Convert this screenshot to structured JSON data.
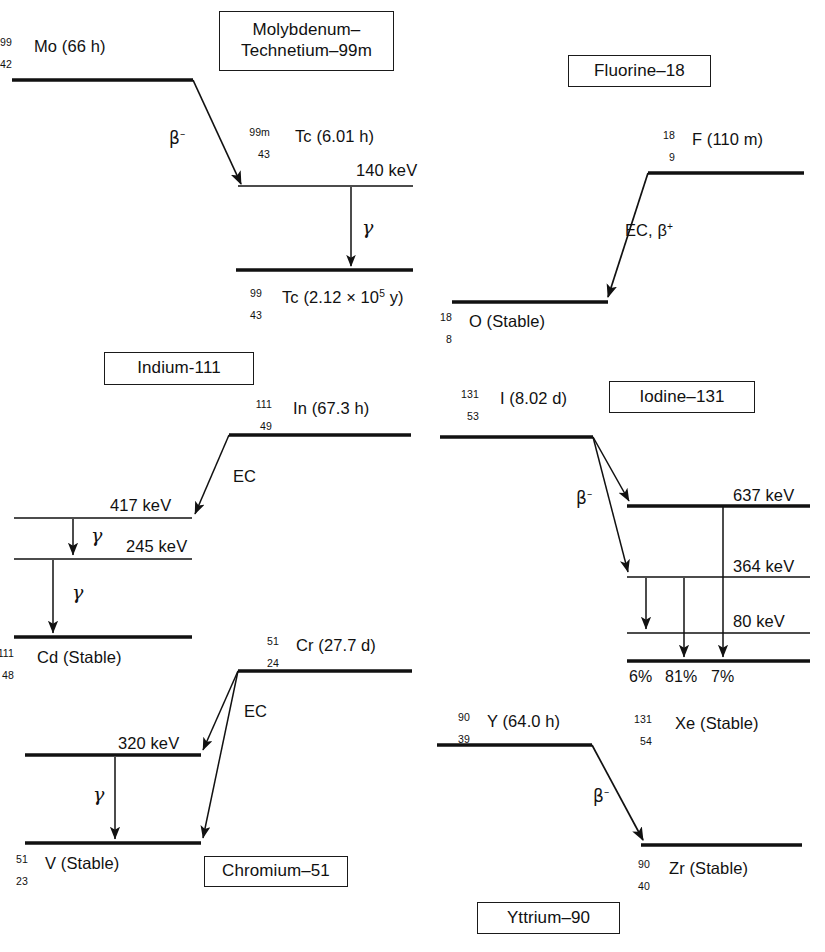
{
  "figure": {
    "type": "nuclear-decay-scheme-diagram",
    "panel_count": 6
  },
  "panels": [
    {
      "id": "molybdenum-technetium",
      "title": "Molybdenum–\nTechnetium–99m",
      "parent": {
        "mass": "99",
        "atomic": "42",
        "symbol": "Mo",
        "halflife": "(66 h)",
        "text": "Mo (66 h)"
      },
      "transitions": [
        {
          "label": "β⁻",
          "type": "beta-minus"
        },
        {
          "label": "γ",
          "type": "gamma"
        }
      ],
      "levels": [
        {
          "name": "Tc-99m",
          "energy": "140 keV",
          "label_mass": "99m",
          "label_atomic": "43",
          "label_symbol": "Tc",
          "label_halflife": "(6.01 h)"
        },
        {
          "name": "Tc-99",
          "energy": "",
          "label_mass": "99",
          "label_atomic": "43",
          "label_symbol": "Tc",
          "label_halflife": "(2.12 × 10⁵ y)"
        }
      ]
    },
    {
      "id": "fluorine-18",
      "title": "Fluorine–18",
      "parent": {
        "mass": "18",
        "atomic": "9",
        "symbol": "F",
        "halflife": "(110 m)"
      },
      "transitions": [
        {
          "label": "EC, β⁺",
          "type": "electron-capture-beta-plus"
        }
      ],
      "levels": [
        {
          "name": "O-18",
          "label_mass": "18",
          "label_atomic": "8",
          "label_symbol": "O",
          "label_halflife": "(Stable)"
        }
      ]
    },
    {
      "id": "indium-111",
      "title": "Indium-111",
      "parent": {
        "mass": "111",
        "atomic": "49",
        "symbol": "In",
        "halflife": "(67.3 h)"
      },
      "transitions": [
        {
          "label": "EC",
          "type": "electron-capture"
        },
        {
          "label": "γ",
          "type": "gamma"
        },
        {
          "label": "γ",
          "type": "gamma"
        }
      ],
      "levels": [
        {
          "name": "level-417",
          "energy": "417 keV"
        },
        {
          "name": "level-245",
          "energy": "245 keV"
        },
        {
          "name": "Cd-111",
          "label_mass": "111",
          "label_atomic": "48",
          "label_symbol": "Cd",
          "label_halflife": "(Stable)"
        }
      ]
    },
    {
      "id": "iodine-131",
      "title": "Iodine–131",
      "parent": {
        "mass": "131",
        "atomic": "53",
        "symbol": "I",
        "halflife": "(8.02 d)"
      },
      "transitions": [
        {
          "label": "β⁻",
          "type": "beta-minus"
        }
      ],
      "levels": [
        {
          "name": "level-637",
          "energy": "637 keV"
        },
        {
          "name": "level-364",
          "energy": "364 keV"
        },
        {
          "name": "level-80",
          "energy": "80 keV"
        },
        {
          "name": "Xe-131",
          "label_mass": "131",
          "label_atomic": "54",
          "label_symbol": "Xe",
          "label_halflife": "(Stable)"
        }
      ],
      "branches": [
        "6%",
        "81%",
        "7%"
      ]
    },
    {
      "id": "chromium-51",
      "title": "Chromium–51",
      "parent": {
        "mass": "51",
        "atomic": "24",
        "symbol": "Cr",
        "halflife": "(27.7 d)"
      },
      "transitions": [
        {
          "label": "EC",
          "type": "electron-capture"
        },
        {
          "label": "γ",
          "type": "gamma"
        }
      ],
      "levels": [
        {
          "name": "level-320",
          "energy": "320 keV"
        },
        {
          "name": "V-51",
          "label_mass": "51",
          "label_atomic": "23",
          "label_symbol": "V",
          "label_halflife": "(Stable)"
        }
      ]
    },
    {
      "id": "yttrium-90",
      "title": "Yttrium–90",
      "parent": {
        "mass": "90",
        "atomic": "39",
        "symbol": "Y",
        "halflife": "(64.0 h)"
      },
      "transitions": [
        {
          "label": "β⁻",
          "type": "beta-minus"
        }
      ],
      "levels": [
        {
          "name": "Zr-90",
          "label_mass": "90",
          "label_atomic": "40",
          "label_symbol": "Zr",
          "label_halflife": "(Stable)"
        }
      ]
    }
  ],
  "text": {
    "mo99_halflife": "Mo (66 h)",
    "mo99_mass": "99",
    "mo99_atomic": "42",
    "tc99m_symbol": "Tc (6.01 h)",
    "tc99m_mass": "99m",
    "tc99m_atomic": "43",
    "tc99_symbol": "Tc (2.12 × 10",
    "tc99_exp": "5",
    "tc99_tail": " y)",
    "tc99_mass": "99",
    "tc99_atomic": "43",
    "kev_140": "140 keV",
    "beta_minus": "β",
    "beta_minus_sign": "–",
    "gamma": "γ",
    "title_moTc": "Molybdenum–\nTechnetium–99m",
    "title_f18": "Fluorine–18",
    "f18_symbol": "F (110 m)",
    "f18_mass": "18",
    "f18_atomic": "9",
    "ec_beta_plus": "EC, β",
    "ec_beta_plus_sign": "+",
    "o18_symbol": "O (Stable)",
    "o18_mass": "18",
    "o18_atomic": "8",
    "title_in111": "Indium-111",
    "in111_symbol": "In (67.3 h)",
    "in111_mass": "111",
    "in111_atomic": "49",
    "ec": "EC",
    "kev_417": "417 keV",
    "kev_245": "245 keV",
    "cd111_symbol": "Cd (Stable)",
    "cd111_mass": "111",
    "cd111_atomic": "48",
    "title_i131": "Iodine–131",
    "i131_symbol": "I (8.02 d)",
    "i131_mass": "131",
    "i131_atomic": "53",
    "kev_637": "637 keV",
    "kev_364": "364 keV",
    "kev_80": "80 keV",
    "pct_6": "6%",
    "pct_81": "81%",
    "pct_7": "7%",
    "xe131_symbol": "Xe (Stable)",
    "xe131_mass": "131",
    "xe131_atomic": "54",
    "title_cr51": "Chromium–51",
    "cr51_symbol": "Cr (27.7 d)",
    "cr51_mass": "51",
    "cr51_atomic": "24",
    "kev_320": "320 keV",
    "v51_symbol": "V (Stable)",
    "v51_mass": "51",
    "v51_atomic": "23",
    "title_y90": "Yttrium–90",
    "y90_symbol": "Y (64.0 h)",
    "y90_mass": "90",
    "y90_atomic": "39",
    "zr90_symbol": "Zr (Stable)",
    "zr90_mass": "90",
    "zr90_atomic": "40"
  },
  "colors": {
    "ink": "#111111",
    "background": "#ffffff"
  }
}
